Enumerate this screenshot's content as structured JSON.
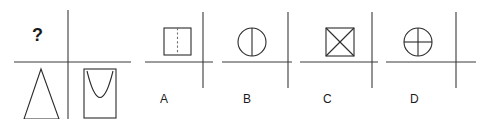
{
  "puzzle": {
    "type": "visual-analogy-multiple-choice",
    "question_symbol": "?",
    "question_panel": {
      "name": "question-panel",
      "quadrants": {
        "top_left": "question-mark",
        "top_right": "empty",
        "bottom_left": "narrow-triangle",
        "bottom_right": "rectangle-with-parabola"
      }
    },
    "options": [
      {
        "label": "A",
        "figure": "square-with-vertical-dashed-line",
        "quadrant": "top-left"
      },
      {
        "label": "B",
        "figure": "circle-with-vertical-diameter",
        "quadrant": "top-left"
      },
      {
        "label": "C",
        "figure": "square-with-two-diagonals",
        "quadrant": "top-left"
      },
      {
        "label": "D",
        "figure": "circle-with-cross",
        "quadrant": "top-left"
      }
    ],
    "colors": {
      "background": "#ffffff",
      "stroke": "#2b2b2b",
      "axis": "#3a3a3a",
      "dashed": "#6e6e6e",
      "text": "#1a1a1a"
    }
  }
}
